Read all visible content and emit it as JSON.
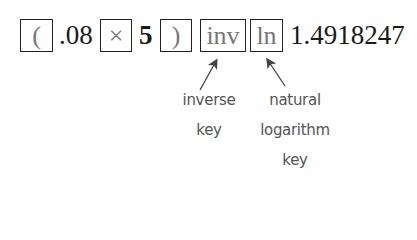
{
  "sequence": {
    "open_paren_key": "(",
    "value_1": ".08",
    "multiply_key": "×",
    "value_2": "5",
    "close_paren_key": ")",
    "inverse_key": "inv",
    "ln_key": "ln",
    "result": "1.4918247"
  },
  "annotations": {
    "inverse": {
      "line1": "inverse",
      "line2": "key"
    },
    "natural_log": {
      "line1": "natural",
      "line2": "logarithm",
      "line3": "key"
    }
  },
  "colors": {
    "key_border": "#222222",
    "key_text": "#777777",
    "label_text": "#555555"
  }
}
